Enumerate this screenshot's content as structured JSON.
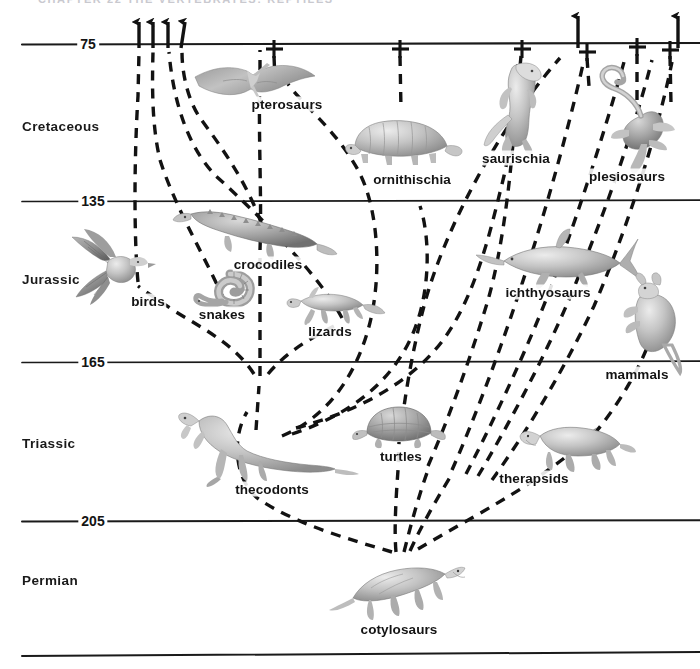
{
  "page": {
    "header_remnant": "CHAPTER 22   THE VERTEBRATES: REPTILES",
    "width": 700,
    "height": 669,
    "background_color": "#ffffff",
    "line_color": "#1a1a1a"
  },
  "axis": {
    "unit_note": "millions of years ago",
    "age_labels": [
      {
        "value": "75",
        "x": 88,
        "y": 44
      },
      {
        "value": "135",
        "x": 93,
        "y": 201
      },
      {
        "value": "165",
        "x": 93,
        "y": 362
      },
      {
        "value": "205",
        "x": 93,
        "y": 521
      }
    ],
    "rule_lines": [
      {
        "name": "line-75",
        "y": 44,
        "x1": 22,
        "x2": 700
      },
      {
        "name": "line-135",
        "y": 201,
        "x1": 22,
        "x2": 700
      },
      {
        "name": "line-165",
        "y": 362,
        "x1": 22,
        "x2": 700
      },
      {
        "name": "line-205",
        "y": 521,
        "x1": 22,
        "x2": 700
      },
      {
        "name": "line-base",
        "y": 655,
        "x1": 22,
        "x2": 700
      }
    ]
  },
  "periods": [
    {
      "name": "Cretaceous",
      "x": 22,
      "y": 126,
      "range_mya": [
        135,
        75
      ]
    },
    {
      "name": "Jurassic",
      "x": 22,
      "y": 279,
      "range_mya": [
        165,
        135
      ]
    },
    {
      "name": "Triassic",
      "x": 22,
      "y": 443,
      "range_mya": [
        205,
        165
      ]
    },
    {
      "name": "Permian",
      "x": 22,
      "y": 580,
      "range_mya": [
        null,
        205
      ]
    }
  ],
  "taxa": [
    {
      "id": "pterosaurs",
      "label": "pterosaurs",
      "label_x": 287,
      "label_y": 104,
      "icon_x": 253,
      "icon_y": 79,
      "fate": "extinct"
    },
    {
      "id": "ornithischia",
      "label": "ornithischia",
      "label_x": 412,
      "label_y": 179,
      "icon_x": 399,
      "icon_y": 141,
      "fate": "extinct"
    },
    {
      "id": "saurischia",
      "label": "saurischia",
      "label_x": 516,
      "label_y": 158,
      "icon_x": 520,
      "icon_y": 105,
      "fate": "extinct"
    },
    {
      "id": "plesiosaurs",
      "label": "plesiosaurs",
      "label_x": 627,
      "label_y": 176,
      "icon_x": 639,
      "icon_y": 110,
      "fate": "extinct"
    },
    {
      "id": "crocodiles",
      "label": "crocodiles",
      "label_x": 268,
      "label_y": 264,
      "icon_x": 253,
      "icon_y": 228,
      "fate": "surviving"
    },
    {
      "id": "birds",
      "label": "birds",
      "label_x": 148,
      "label_y": 301,
      "icon_x": 114,
      "icon_y": 265,
      "fate": "surviving"
    },
    {
      "id": "snakes",
      "label": "snakes",
      "label_x": 222,
      "label_y": 314,
      "icon_x": 224,
      "icon_y": 288,
      "fate": "surviving"
    },
    {
      "id": "lizards",
      "label": "lizards",
      "label_x": 330,
      "label_y": 331,
      "icon_x": 327,
      "icon_y": 303,
      "fate": "surviving"
    },
    {
      "id": "ichthyosaurs",
      "label": "ichthyosaurs",
      "label_x": 548,
      "label_y": 292,
      "icon_x": 558,
      "icon_y": 259,
      "fate": "extinct"
    },
    {
      "id": "mammals",
      "label": "mammals",
      "label_x": 637,
      "label_y": 374,
      "icon_x": 654,
      "icon_y": 315,
      "fate": "surviving"
    },
    {
      "id": "thecodonts",
      "label": "thecodonts",
      "label_x": 272,
      "label_y": 489,
      "icon_x": 243,
      "icon_y": 443,
      "fate": "extinct"
    },
    {
      "id": "turtles",
      "label": "turtles",
      "label_x": 401,
      "label_y": 456,
      "icon_x": 399,
      "icon_y": 427,
      "fate": "surviving"
    },
    {
      "id": "therapsids",
      "label": "therapsids",
      "label_x": 534,
      "label_y": 478,
      "icon_x": 578,
      "icon_y": 442,
      "fate": "extinct"
    },
    {
      "id": "cotylosaurs",
      "label": "cotylosaurs",
      "label_x": 399,
      "label_y": 629,
      "icon_x": 399,
      "icon_y": 586,
      "fate": "ancestral"
    }
  ],
  "markers": {
    "extinction_symbol": "+",
    "extinction_crosses": [
      {
        "for": "pterosaurs",
        "x": 274,
        "y": 49
      },
      {
        "for": "ornithischia",
        "x": 400,
        "y": 49
      },
      {
        "for": "saurischia",
        "x": 523,
        "y": 49
      },
      {
        "for": "plesiosaurs",
        "x": 587,
        "y": 52
      },
      {
        "for": "unnamed-a",
        "x": 637,
        "y": 47
      },
      {
        "for": "unnamed-b",
        "x": 670,
        "y": 50
      }
    ],
    "survival_arrows": [
      {
        "for": "birds",
        "x": 140,
        "y": 44
      },
      {
        "for": "snakes",
        "x": 154,
        "y": 44
      },
      {
        "for": "lizards",
        "x": 168,
        "y": 44
      },
      {
        "for": "crocodiles",
        "x": 182,
        "y": 44
      },
      {
        "for": "mammals",
        "x": 578,
        "y": 44
      },
      {
        "for": "turtles",
        "x": 678,
        "y": 44
      }
    ]
  },
  "nodes": [
    {
      "id": "node-thecodont-radiation",
      "x": 260,
      "y": 380
    },
    {
      "id": "node-cotylosaur-root",
      "x": 399,
      "y": 558
    }
  ],
  "colors": {
    "ink": "#1a1a1a",
    "dash": "#121212",
    "organism_light": "#d9d9d9",
    "organism_mid": "#a8a8a8",
    "organism_dark": "#6d6d6d",
    "paper": "#ffffff"
  }
}
